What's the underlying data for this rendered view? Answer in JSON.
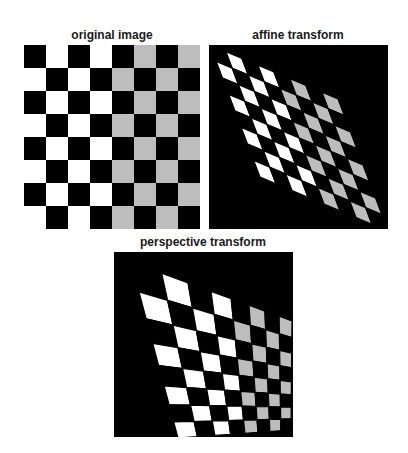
{
  "figure": {
    "panels": [
      {
        "id": "original",
        "title": "original image",
        "box": {
          "x": 24,
          "y": 45,
          "w": 176,
          "h": 184
        },
        "title_center_x": 112,
        "title_y": 28,
        "transform": "none",
        "corners": {
          "p00": [
            24,
            45
          ],
          "p80": [
            200,
            45
          ],
          "p08": [
            24,
            229
          ],
          "p88": [
            200,
            229
          ]
        }
      },
      {
        "id": "affine",
        "title": "affine transform",
        "box": {
          "x": 209,
          "y": 45,
          "w": 179,
          "h": 184
        },
        "title_center_x": 298,
        "title_y": 28,
        "transform": "affine",
        "corners": {
          "p00": [
            210,
            45
          ],
          "p80": [
            338,
            99
          ],
          "p08": [
            260,
            177
          ],
          "p88": [
            388,
            231
          ]
        }
      },
      {
        "id": "perspective",
        "title": "perspective transform",
        "box": {
          "x": 114,
          "y": 252,
          "w": 179,
          "h": 185
        },
        "title_center_x": 203,
        "title_y": 235,
        "transform": "perspective",
        "corners": {
          "p00": [
            131,
            262
          ],
          "p80": [
            292,
            321
          ],
          "p08": [
            178,
            438
          ],
          "p88": [
            291,
            430
          ]
        }
      }
    ],
    "checkerboard": {
      "rows": 8,
      "cols": 8,
      "top_left_cell": "dark",
      "left_half_light_color": "#ffffff",
      "right_half_light_color": "#bdbdbd",
      "dark_color": "#000000",
      "split_column": 4
    },
    "background_outside_transformed": "#000000"
  }
}
